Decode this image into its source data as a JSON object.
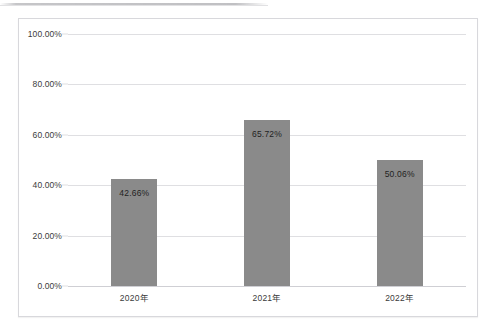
{
  "chart_data": {
    "type": "bar",
    "title": "",
    "subtitle": "",
    "xlabel": "",
    "ylabel": "",
    "categories": [
      "2020年",
      "2021年",
      "2022年"
    ],
    "values": [
      42.66,
      65.72,
      50.06
    ],
    "data_labels": [
      "42.66%",
      "65.72%",
      "50.06%"
    ],
    "ylim": [
      0,
      100
    ],
    "ytick_values": [
      0,
      20,
      40,
      60,
      80,
      100
    ],
    "ytick_labels": [
      "0.00%",
      "20.00%",
      "40.00%",
      "60.00%",
      "80.00%",
      "100.00%"
    ],
    "grid": true,
    "grid_axis": "y",
    "legend": false,
    "legend_position": "none",
    "series": [
      {
        "name": "",
        "values": [
          42.66,
          65.72,
          50.06
        ]
      }
    ]
  },
  "style": {
    "bar_color": "#8a8a8a",
    "gridline_color": "#dfdfe2",
    "frame_border_color": "#d8d8dc",
    "plot_background": "#ffffff",
    "tick_label_color": "#3b3b3b",
    "data_label_color": "#1f1f1f"
  }
}
